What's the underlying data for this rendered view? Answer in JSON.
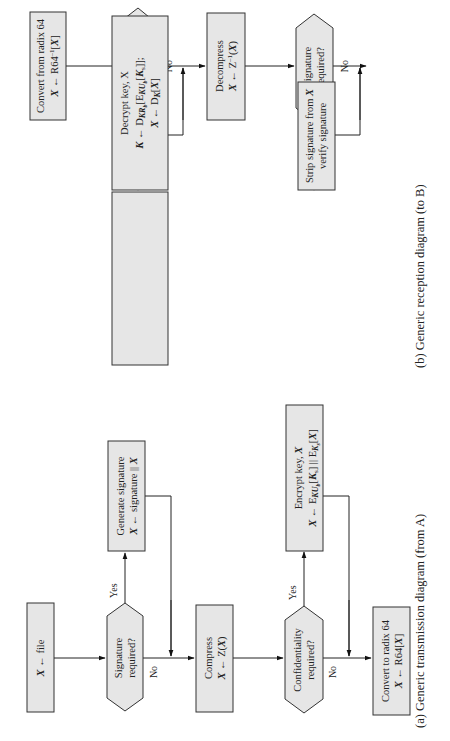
{
  "diagram_b": {
    "caption": "(b) Generic reception diagram (to B)",
    "convert_from": {
      "line1": "Convert from radix 64",
      "line2": "X ← R64⁻¹[X]"
    },
    "confidentiality": {
      "line1": "Confidentiality",
      "line2": "required?"
    },
    "decrypt": {
      "line1": "Decrypt key, X",
      "line2": "K ← D_KRb[E_KUb[Ks]];",
      "line3": "X ← D_K[X]"
    },
    "decompress": {
      "line1": "Decompress",
      "line2": "X ← Z⁻¹(X)"
    },
    "signature": {
      "line1": "Signature",
      "line2": "required?"
    },
    "strip": {
      "line1": "Strip signature from X",
      "line2": "verify signature"
    },
    "yes1": "Yes",
    "no1": "No",
    "yes2": "Yes",
    "no2": "No"
  },
  "diagram_a": {
    "caption": "(a) Generic transmission diagram (from A)",
    "file": {
      "line1": "X ← file"
    },
    "signature": {
      "line1": "Signature",
      "line2": "required?"
    },
    "generate": {
      "line1": "Generate signature",
      "line2": "X ← signature || X"
    },
    "compress": {
      "line1": "Compress",
      "line2": "X ← Z(X)"
    },
    "confidentiality": {
      "line1": "Confidentiality",
      "line2": "required?"
    },
    "encrypt": {
      "line1": "Encrypt key, X",
      "line2": "X ← E_KUb[Ks] || E_Ks[X]"
    },
    "convert_to": {
      "line1": "Convert to radix 64",
      "line2": "X ← R64[X]"
    },
    "yes1": "Yes",
    "no1": "No",
    "yes2": "Yes",
    "no2": "No"
  }
}
